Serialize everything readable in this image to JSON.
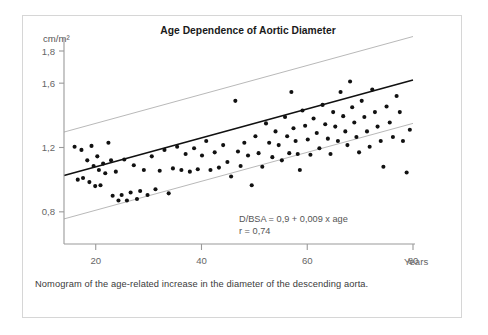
{
  "figure": {
    "title": "Age Dependence of Aortic Diameter",
    "caption": "Nomogram of the age-related increase in the diameter of the descending aorta.",
    "equation_line1": "D/BSA = 0,9 + 0,009 x age",
    "equation_line2": "r = 0,74",
    "y_unit_label": "cm/m²",
    "x_unit_label": "Years"
  },
  "colors": {
    "point": "#111111",
    "regression_line": "#111111",
    "band_line": "#b9b9b9",
    "axis": "#9a9a9a",
    "tick_text": "#666666",
    "title": "#1a1a1a",
    "card_border": "#d6d6d6",
    "background": "#ffffff"
  },
  "chart_data": {
    "type": "scatter",
    "title": "Age Dependence of Aortic Diameter",
    "xlabel": "Years",
    "ylabel": "cm/m²",
    "xlim": [
      14,
      80
    ],
    "ylim": [
      0.6,
      1.8
    ],
    "grid": false,
    "legend": null,
    "x_ticks": [
      20,
      40,
      60,
      80
    ],
    "x_tick_labels": [
      "20",
      "40",
      "60",
      "80"
    ],
    "y_ticks": [
      0.8,
      1.2,
      1.6,
      1.8
    ],
    "y_tick_labels": [
      "0,8",
      "1,2",
      "1,6",
      "1,8"
    ],
    "annotations": [
      {
        "text": "D/BSA = 0,9 + 0,009 x age",
        "x": 48,
        "y": 0.83
      },
      {
        "text": "r = 0,74",
        "x": 48,
        "y": 0.775
      }
    ],
    "fit": {
      "name": "regression",
      "equation": "D/BSA = 0,9 + 0,009 x age",
      "intercept": 0.9,
      "slope": 0.009,
      "r": 0.74,
      "x_start": 14,
      "x_end": 80
    },
    "bands": [
      {
        "name": "upper-limit",
        "intercept": 1.17,
        "slope": 0.009,
        "x_start": 14,
        "x_end": 80
      },
      {
        "name": "lower-limit",
        "intercept": 0.63,
        "slope": 0.009,
        "x_start": 14,
        "x_end": 80
      }
    ],
    "series": [
      {
        "name": "patients",
        "marker": "circle",
        "points": [
          [
            16.0,
            1.205
          ],
          [
            16.6,
            1.0
          ],
          [
            17.3,
            1.185
          ],
          [
            17.6,
            1.01
          ],
          [
            18.4,
            1.12
          ],
          [
            18.8,
            0.985
          ],
          [
            19.2,
            1.21
          ],
          [
            19.6,
            1.085
          ],
          [
            19.9,
            0.96
          ],
          [
            20.3,
            1.145
          ],
          [
            20.6,
            1.06
          ],
          [
            20.9,
            0.965
          ],
          [
            21.4,
            1.1
          ],
          [
            21.8,
            1.04
          ],
          [
            22.4,
            1.23
          ],
          [
            22.9,
            1.12
          ],
          [
            23.2,
            0.9
          ],
          [
            23.8,
            1.05
          ],
          [
            24.3,
            0.87
          ],
          [
            24.9,
            0.905
          ],
          [
            25.4,
            1.125
          ],
          [
            25.9,
            0.87
          ],
          [
            26.6,
            0.92
          ],
          [
            27.2,
            1.09
          ],
          [
            27.8,
            0.88
          ],
          [
            28.4,
            0.93
          ],
          [
            29.1,
            1.06
          ],
          [
            29.8,
            0.905
          ],
          [
            30.6,
            1.145
          ],
          [
            31.3,
            0.94
          ],
          [
            32.1,
            1.055
          ],
          [
            33.0,
            1.185
          ],
          [
            33.8,
            0.915
          ],
          [
            34.6,
            1.07
          ],
          [
            35.4,
            1.205
          ],
          [
            36.2,
            1.06
          ],
          [
            37.0,
            1.16
          ],
          [
            37.8,
            1.05
          ],
          [
            38.6,
            1.195
          ],
          [
            39.3,
            1.065
          ],
          [
            40.1,
            1.15
          ],
          [
            40.9,
            1.24
          ],
          [
            41.7,
            1.06
          ],
          [
            42.5,
            1.17
          ],
          [
            43.3,
            1.075
          ],
          [
            44.1,
            1.215
          ],
          [
            44.9,
            1.11
          ],
          [
            45.6,
            1.02
          ],
          [
            46.4,
            1.49
          ],
          [
            46.9,
            1.175
          ],
          [
            47.4,
            1.085
          ],
          [
            48.1,
            1.23
          ],
          [
            48.8,
            1.15
          ],
          [
            49.5,
            0.965
          ],
          [
            50.2,
            1.27
          ],
          [
            50.8,
            1.165
          ],
          [
            51.5,
            1.08
          ],
          [
            52.2,
            1.35
          ],
          [
            52.8,
            1.23
          ],
          [
            53.4,
            1.14
          ],
          [
            54.0,
            1.3
          ],
          [
            54.6,
            1.215
          ],
          [
            55.2,
            1.12
          ],
          [
            55.8,
            1.39
          ],
          [
            56.2,
            1.27
          ],
          [
            56.6,
            1.165
          ],
          [
            57.0,
            1.545
          ],
          [
            57.4,
            1.32
          ],
          [
            57.8,
            1.24
          ],
          [
            58.2,
            1.16
          ],
          [
            58.6,
            1.06
          ],
          [
            59.1,
            1.43
          ],
          [
            59.6,
            1.335
          ],
          [
            60.1,
            1.25
          ],
          [
            60.6,
            1.155
          ],
          [
            61.2,
            1.38
          ],
          [
            61.8,
            1.29
          ],
          [
            62.3,
            1.195
          ],
          [
            62.9,
            1.465
          ],
          [
            63.4,
            1.345
          ],
          [
            63.9,
            1.255
          ],
          [
            64.4,
            1.16
          ],
          [
            64.9,
            1.42
          ],
          [
            65.3,
            1.33
          ],
          [
            65.8,
            1.24
          ],
          [
            66.3,
            1.545
          ],
          [
            66.8,
            1.395
          ],
          [
            67.2,
            1.3
          ],
          [
            67.6,
            1.215
          ],
          [
            68.1,
            1.61
          ],
          [
            68.5,
            1.45
          ],
          [
            68.9,
            1.355
          ],
          [
            69.3,
            1.265
          ],
          [
            69.8,
            1.17
          ],
          [
            70.3,
            1.49
          ],
          [
            70.8,
            1.39
          ],
          [
            71.3,
            1.3
          ],
          [
            71.8,
            1.205
          ],
          [
            72.3,
            1.56
          ],
          [
            72.8,
            1.42
          ],
          [
            73.3,
            1.33
          ],
          [
            73.9,
            1.24
          ],
          [
            74.4,
            1.08
          ],
          [
            75.0,
            1.455
          ],
          [
            75.6,
            1.355
          ],
          [
            76.2,
            1.265
          ],
          [
            76.9,
            1.52
          ],
          [
            77.5,
            1.42
          ],
          [
            78.1,
            1.24
          ],
          [
            78.8,
            1.045
          ],
          [
            79.4,
            1.31
          ]
        ]
      }
    ]
  }
}
